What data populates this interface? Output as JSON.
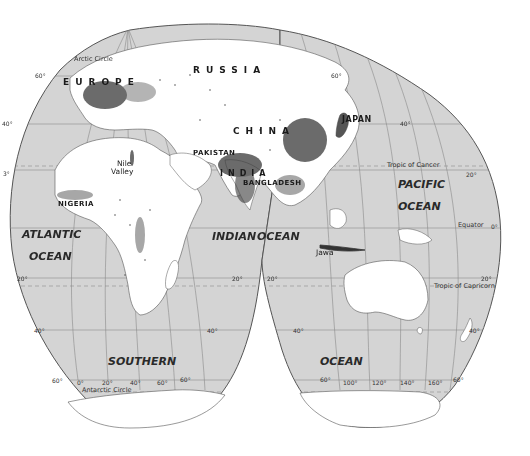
{
  "map": {
    "projection": "interrupted-homolosine",
    "colors": {
      "ocean": "#d4d4d4",
      "land": "#ffffff",
      "outline": "#555555",
      "grid": "#8a8a8a",
      "density": "#3a3a3a"
    },
    "countries": {
      "russia": "RUSSIA",
      "europe": "EUROPE",
      "china": "CHINA",
      "japan": "JAPAN",
      "pakistan": "PAKISTAN",
      "india": "INDIA",
      "bangladesh": "BANGLADESH",
      "nigeria": "NIGERIA"
    },
    "regions": {
      "nile_1": "Nile",
      "nile_2": "Valley",
      "jawa": "Jawa"
    },
    "oceans": {
      "atlantic_1": "ATLANTIC",
      "atlantic_2": "OCEAN",
      "indian": "INDIAN",
      "indian_ocean": "OCEAN",
      "pacific_1": "PACIFIC",
      "pacific_2": "OCEAN",
      "southern": "SOUTHERN",
      "southern_ocean": "OCEAN"
    },
    "lines": {
      "arctic": "Arctic Circle",
      "cancer": "Tropic of Cancer",
      "equator": "Equator",
      "capricorn": "Tropic of Capricorn",
      "antarctic": "Antarctic Circle"
    },
    "degree_labels": {
      "lat_60_nw": "60°",
      "lat_60_ne": "60°",
      "lat_40_w": "40°",
      "lat_40_e": "40°",
      "lat_3_w": "3°",
      "lat_20_ne": "20°",
      "lat_0_e": "0°",
      "lat_20_sw": "20°",
      "lat_20_sm": "20°",
      "lat_20_sm2": "20°",
      "lat_20_se": "20°",
      "lat_40_sw": "40°",
      "lat_40_sm": "40°",
      "lat_40_sm2": "40°",
      "lat_40_se": "40°",
      "lat_60_sw": "60°",
      "lon_0": "0°",
      "lon_20": "20°",
      "lon_40": "40°",
      "lon_60": "60°",
      "lat_60_sm": "60°",
      "lat_60_sm2": "60°",
      "lon_100": "100°",
      "lon_120": "120°",
      "lon_140": "140°",
      "lon_160": "160°",
      "lat_60_se": "60°"
    }
  }
}
